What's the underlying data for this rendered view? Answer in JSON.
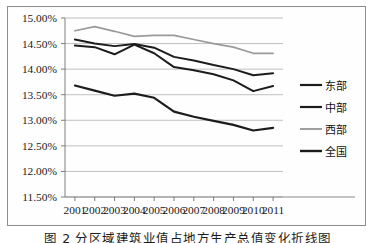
{
  "figure": {
    "caption": "图 2   分区域建筑业值占地方生产总值变化折线图"
  },
  "chart_data": {
    "type": "line",
    "title": "",
    "xlabel": "",
    "ylabel": "",
    "x": [
      "2001",
      "2002",
      "2003",
      "2004",
      "2005",
      "2006",
      "2007",
      "2008",
      "2009",
      "2010",
      "2011"
    ],
    "categories": [
      "2001",
      "2002",
      "2003",
      "2004",
      "2005",
      "2006",
      "2007",
      "2008",
      "2009",
      "2010",
      "2011"
    ],
    "ylim": [
      11.5,
      15.0
    ],
    "ytick_step": 0.5,
    "ytick_labels": [
      "15.00%",
      "14.50%",
      "14.00%",
      "13.50%",
      "13.00%",
      "12.50%",
      "12.00%",
      "11.50%"
    ],
    "ytick_values": [
      15.0,
      14.5,
      14.0,
      13.5,
      13.0,
      12.5,
      12.0,
      11.5
    ],
    "grid": "horizontal",
    "legend_position": "right",
    "series": [
      {
        "name": "东部",
        "color": "#1c1c1c",
        "width": 2.0,
        "values": [
          14.46,
          14.43,
          14.29,
          14.48,
          14.31,
          14.04,
          13.98,
          13.9,
          13.78,
          13.57,
          13.67
        ]
      },
      {
        "name": "中部",
        "color": "#1c1c1c",
        "width": 2.0,
        "values": [
          14.58,
          14.5,
          14.45,
          14.49,
          14.42,
          14.24,
          14.17,
          14.08,
          14.0,
          13.88,
          13.92
        ]
      },
      {
        "name": "西部",
        "color": "#9a9a9a",
        "width": 1.7,
        "values": [
          14.75,
          14.83,
          14.74,
          14.64,
          14.66,
          14.66,
          14.58,
          14.5,
          14.43,
          14.31,
          14.31
        ]
      },
      {
        "name": "全国",
        "color": "#1c1c1c",
        "width": 2.2,
        "values": [
          13.68,
          13.58,
          13.48,
          13.52,
          13.44,
          13.17,
          13.07,
          12.99,
          12.91,
          12.8,
          12.85
        ]
      }
    ]
  },
  "legend": {
    "items": [
      {
        "label": "东部"
      },
      {
        "label": "中部"
      },
      {
        "label": "西部"
      },
      {
        "label": "全国"
      }
    ]
  }
}
